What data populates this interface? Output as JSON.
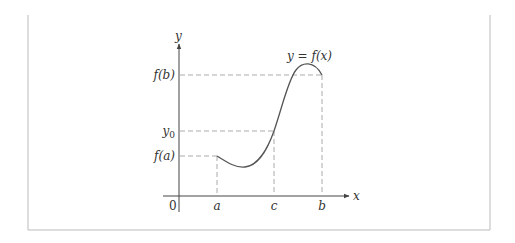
{
  "figure": {
    "curve_label": "y = f(x)",
    "axes": {
      "x_label": "x",
      "y_label": "y",
      "origin_label": "0"
    },
    "y_ticks": [
      {
        "label": "f(b)",
        "y": 75
      },
      {
        "label": "y0",
        "y": 131
      },
      {
        "label": "f(a)",
        "y": 156
      }
    ],
    "x_ticks": [
      {
        "label": "a",
        "x": 217
      },
      {
        "label": "c",
        "x": 274
      },
      {
        "label": "b",
        "x": 322
      }
    ],
    "colors": {
      "curve": "#555555",
      "axis": "#444444",
      "dashed": "#aaaaaa",
      "frame": "#bbbbbb"
    }
  }
}
